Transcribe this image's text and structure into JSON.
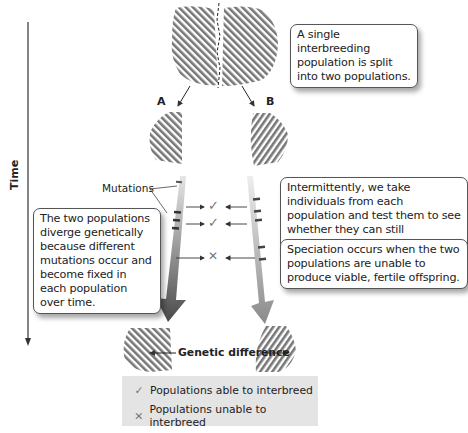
{
  "labels": {
    "time_axis": "Time",
    "population_a": "A",
    "population_b": "B",
    "mutations": "Mutations",
    "genetic_difference": "Genetic difference"
  },
  "callouts": {
    "split": "A single interbreeding population is split into two populations.",
    "diverge": "The two populations diverge genetically because different mutations occur and become fixed in each population over time.",
    "test": "Intermittently, we take individuals from each population and test them to see whether they can still interbreed.",
    "speciation": "Speciation occurs when the two populations are unable to produce viable, fertile offspring."
  },
  "tests": [
    {
      "result": "able",
      "glyph": "✓"
    },
    {
      "result": "able",
      "glyph": "✓"
    },
    {
      "result": "unable",
      "glyph": "✕"
    }
  ],
  "legend": {
    "items": [
      {
        "glyph": "✓",
        "label": "Populations able to interbreed"
      },
      {
        "glyph": "✕",
        "label": "Populations unable to interbreed"
      }
    ]
  },
  "colors": {
    "hatch": "#777777",
    "arrow_dark": "#555555",
    "arrow_light": "#bdbdbd",
    "legend_bg": "#e4e4e4",
    "line": "#333333"
  }
}
